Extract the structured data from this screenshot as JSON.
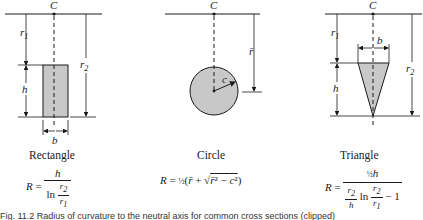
{
  "figure": {
    "panels": [
      {
        "name": "Rectangle",
        "center_label": "C",
        "dimension_labels": [
          "r1",
          "r2",
          "h",
          "b"
        ],
        "formula": {
          "lhs": "R =",
          "numerator": "h",
          "denominator_prefix": "ln",
          "denominator_num": "r2",
          "denominator_den": "r1"
        }
      },
      {
        "name": "Circle",
        "center_label": "C",
        "dimension_labels": [
          "r̄",
          "c"
        ],
        "formula": {
          "text": "R = ½(r̄ + √(r̄² − c²))"
        }
      },
      {
        "name": "Triangle",
        "center_label": "C",
        "dimension_labels": [
          "r1",
          "r2",
          "h",
          "b"
        ],
        "formula": {
          "lhs": "R =",
          "numerator": "½h",
          "denominator": "(r2/h) ln (r2/r1) − 1"
        }
      }
    ],
    "caption": "Fig. 11.2  Radius of curvature to the neutral axis for common cross sections (clipped)"
  },
  "colors": {
    "fill": "#c8c8c8",
    "ink": "#1a1a1a",
    "background": "#ffffff"
  }
}
